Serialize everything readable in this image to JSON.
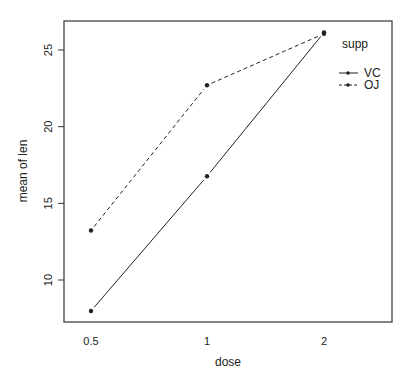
{
  "chart_data": {
    "type": "line",
    "title": "",
    "xlabel": "dose",
    "ylabel": "mean of len",
    "categories": [
      "0.5",
      "1",
      "2"
    ],
    "series": [
      {
        "name": "VC",
        "values": [
          7.98,
          16.77,
          26.14
        ],
        "line_style": "solid",
        "marker": "filled-circle"
      },
      {
        "name": "OJ",
        "values": [
          13.23,
          22.7,
          26.06
        ],
        "line_style": "dashed",
        "marker": "filled-circle"
      }
    ],
    "ylim": [
      7.2,
      26.9
    ],
    "yticks": [
      10,
      15,
      20,
      25
    ],
    "legend": {
      "title": "supp",
      "position": "top-right-inside",
      "entries": [
        "VC",
        "OJ"
      ]
    },
    "grid": false
  },
  "colors": {
    "line": "#222222",
    "axis": "#333333",
    "background": "#ffffff"
  }
}
